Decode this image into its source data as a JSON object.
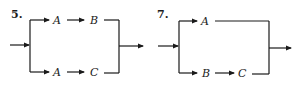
{
  "diagrams": [
    {
      "number": "5.",
      "description": "Parallel system: top branch A then B, bottom branch A then C",
      "top_branch": [
        "A",
        "B"
      ],
      "bottom_branch": [
        "A",
        "C"
      ]
    },
    {
      "number": "7.",
      "description": "Parallel system: top branch A, bottom branch B then C",
      "top_branch": [
        "A"
      ],
      "bottom_branch": [
        "B",
        "C"
      ]
    }
  ],
  "colors": {
    "line": "#1a1a1a",
    "background": "#ffffff"
  }
}
